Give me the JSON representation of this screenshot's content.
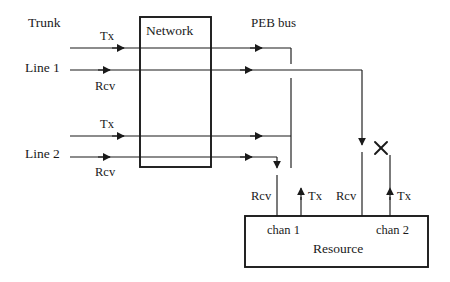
{
  "diagram": {
    "background_color": "#ffffff",
    "line_color": "#1a1a1a",
    "text_color": "#1a1a1a"
  },
  "labels": {
    "trunk": "Trunk",
    "line1": "Line 1",
    "line2": "Line 2",
    "peb_bus": "PEB bus",
    "network_box": "Network",
    "resource_box": "Resource",
    "chan1": "chan 1",
    "chan2": "chan 2",
    "trunk_tx": "Tx",
    "line1_rcv": "Rcv",
    "line2_tx": "Tx",
    "line2_rcv": "Rcv",
    "chan1_rcv": "Rcv",
    "chan1_tx": "Tx",
    "chan2_rcv": "Rcv",
    "chan2_tx": "Tx"
  },
  "boxes": [
    {
      "name": "network",
      "label": "Network",
      "x": 140,
      "y": 17,
      "width": 71,
      "height": 150
    },
    {
      "name": "resource",
      "label": "Resource",
      "x": 245,
      "y": 216,
      "width": 183,
      "height": 51
    }
  ],
  "signals": [
    {
      "name": "trunk-tx",
      "label": "Tx",
      "direction": "left",
      "y": 48
    },
    {
      "name": "line1-rcv",
      "label": "Rcv",
      "direction": "right",
      "y": 70
    },
    {
      "name": "line2-tx",
      "label": "Tx",
      "direction": "left",
      "y": 136
    },
    {
      "name": "line2-rcv",
      "label": "Rcv",
      "direction": "right",
      "y": 157
    }
  ],
  "channel_ports": [
    {
      "name": "chan1-rcv",
      "label": "Rcv",
      "channel": "chan 1",
      "direction": "in"
    },
    {
      "name": "chan1-tx",
      "label": "Tx",
      "channel": "chan 1",
      "direction": "out"
    },
    {
      "name": "chan2-rcv",
      "label": "Rcv",
      "channel": "chan 2",
      "direction": "in"
    },
    {
      "name": "chan2-tx",
      "label": "Tx",
      "channel": "chan 2",
      "direction": "out"
    }
  ],
  "markers": [
    {
      "name": "blocked-cross",
      "symbol": "X",
      "x": 381,
      "y": 148,
      "meaning": "connection blocked"
    }
  ]
}
